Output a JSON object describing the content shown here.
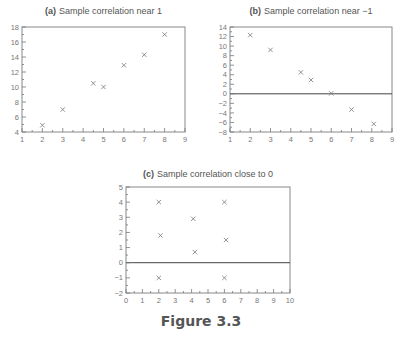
{
  "figure": {
    "caption": "Figure 3.3"
  },
  "chart_data": [
    {
      "type": "scatter",
      "id": "a",
      "title_prefix": "(a)",
      "title": "Sample correlation near 1",
      "xlabel": "",
      "ylabel": "",
      "xlim": [
        1,
        9
      ],
      "ylim": [
        4,
        18
      ],
      "xticks": [
        1,
        2,
        3,
        4,
        5,
        6,
        7,
        8,
        9
      ],
      "yticks": [
        4,
        6,
        8,
        10,
        12,
        14,
        16,
        18
      ],
      "zero_line": false,
      "marker": "x",
      "points": [
        [
          2,
          4.9
        ],
        [
          3,
          7.0
        ],
        [
          4.5,
          10.5
        ],
        [
          5,
          10.0
        ],
        [
          6,
          12.9
        ],
        [
          7,
          14.3
        ],
        [
          8,
          17.0
        ]
      ]
    },
    {
      "type": "scatter",
      "id": "b",
      "title_prefix": "(b)",
      "title": "Sample correlation near −1",
      "xlabel": "",
      "ylabel": "",
      "xlim": [
        1,
        9
      ],
      "ylim": [
        -8,
        14
      ],
      "xticks": [
        1,
        2,
        3,
        4,
        5,
        6,
        7,
        8,
        9
      ],
      "yticks": [
        -8,
        -6,
        -4,
        -2,
        0,
        2,
        4,
        6,
        8,
        10,
        12,
        14
      ],
      "zero_line": true,
      "marker": "x",
      "points": [
        [
          2,
          12.3
        ],
        [
          3,
          9.2
        ],
        [
          4.5,
          4.5
        ],
        [
          5,
          2.9
        ],
        [
          6,
          0.1
        ],
        [
          7,
          -3.3
        ],
        [
          8.1,
          -6.3
        ]
      ]
    },
    {
      "type": "scatter",
      "id": "c",
      "title_prefix": "(c)",
      "title": "Sample correlation close to 0",
      "xlabel": "",
      "ylabel": "",
      "xlim": [
        0,
        10
      ],
      "ylim": [
        -2,
        5
      ],
      "xticks": [
        0,
        1,
        2,
        3,
        4,
        5,
        6,
        7,
        8,
        9,
        10
      ],
      "yticks": [
        -2,
        -1,
        0,
        1,
        2,
        3,
        4,
        5
      ],
      "zero_line": true,
      "marker": "x",
      "points": [
        [
          2,
          4.0
        ],
        [
          6,
          4.0
        ],
        [
          4.1,
          2.9
        ],
        [
          2.1,
          1.8
        ],
        [
          6.1,
          1.5
        ],
        [
          4.2,
          0.7
        ],
        [
          2,
          -1.0
        ],
        [
          6,
          -1.0
        ]
      ]
    }
  ]
}
